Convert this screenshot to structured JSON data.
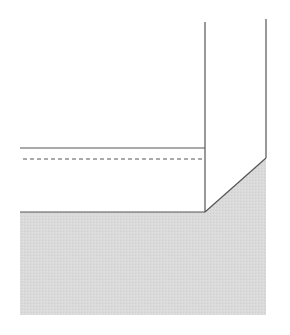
{
  "diagram": {
    "type": "cross-section drawing",
    "width": 290,
    "height": 335,
    "colors": {
      "background": "#ffffff",
      "stroke": "#555555",
      "fill": "#d9d9d9"
    },
    "shapes": {
      "shaded_region": {
        "points": "20,212 205,212 266,158 266,315 20,315"
      },
      "left_vertical": {
        "x1": 205,
        "y1": 22,
        "x2": 205,
        "y2": 212
      },
      "right_vertical": {
        "x1": 266,
        "y1": 19,
        "x2": 266,
        "y2": 158
      },
      "diagonal": {
        "x1": 205,
        "y1": 212,
        "x2": 266,
        "y2": 158
      },
      "bottom_edge": {
        "x1": 20,
        "y1": 212,
        "x2": 205,
        "y2": 212
      },
      "solid_line": {
        "x1": 20,
        "y1": 148,
        "x2": 205,
        "y2": 148
      },
      "dashed_line": {
        "x1": 23,
        "y1": 159,
        "x2": 205,
        "y2": 159
      }
    }
  }
}
